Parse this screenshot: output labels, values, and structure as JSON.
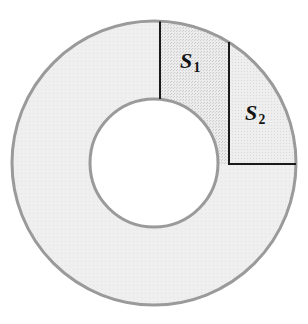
{
  "figure": {
    "background_color": "#ffffff",
    "width": 308,
    "height": 324
  },
  "annulus": {
    "center_x": 154,
    "center_y": 163,
    "outer_radius": 142,
    "inner_radius": 64,
    "fill_color": "#ededed",
    "stroke_color": "#9a9a9a",
    "stroke_width": 3,
    "inner_fill_color": "#ffffff"
  },
  "regions": [
    {
      "id": "S1",
      "label": "S",
      "subscript": "1",
      "fill_color": "#e0e0e0",
      "label_x": 196,
      "label_y": 65,
      "start_angle_deg": 90,
      "end_angle_deg": 58
    },
    {
      "id": "S2",
      "label": "S",
      "subscript": "2",
      "fill_color": "#e6e6e6",
      "label_x": 262,
      "label_y": 117,
      "start_angle_deg": 58,
      "end_angle_deg": 0
    }
  ],
  "dividers": [
    {
      "id": "radius-top-vertical",
      "type": "line",
      "x1": 160,
      "y1": 21,
      "x2": 160,
      "y2": 99,
      "stroke_color": "#1a1a1a",
      "stroke_width": 2
    },
    {
      "id": "chord-vertical-s1-s2",
      "type": "line",
      "x1": 229,
      "y1": 42,
      "x2": 229,
      "y2": 164,
      "stroke_color": "#1a1a1a",
      "stroke_width": 2
    },
    {
      "id": "radius-right-horizontal",
      "type": "line",
      "x1": 229,
      "y1": 164,
      "x2": 296,
      "y2": 164,
      "stroke_color": "#1a1a1a",
      "stroke_width": 2
    }
  ],
  "labels": {
    "s1_text": "S",
    "s1_sub": "1",
    "s2_text": "S",
    "s2_sub": "2"
  }
}
